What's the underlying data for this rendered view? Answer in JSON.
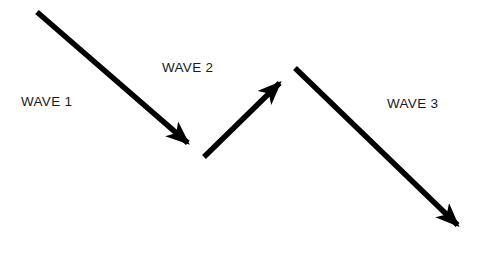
{
  "diagram": {
    "background_color": "#ffffff",
    "stroke_color": "#000000",
    "stroke_width": 5.5,
    "width": 497,
    "height": 260,
    "labels": [
      {
        "id": "wave-1",
        "text": "WAVE 1",
        "x": 21,
        "y": 95
      },
      {
        "id": "wave-2",
        "text": "WAVE 2",
        "x": 162,
        "y": 61
      },
      {
        "id": "wave-3",
        "text": "WAVE 3",
        "x": 387,
        "y": 97
      }
    ],
    "arrows": [
      {
        "id": "wave-1-arrow",
        "name": "wave-1-down-arrow",
        "direction": "down-right",
        "from": {
          "x": 37,
          "y": 12
        },
        "to": {
          "x": 204,
          "y": 157
        },
        "arrowhead": "filled-triangle"
      },
      {
        "id": "wave-2-arrow",
        "name": "wave-2-up-arrow",
        "direction": "up-right",
        "from": {
          "x": 204,
          "y": 157
        },
        "to": {
          "x": 295,
          "y": 68
        },
        "arrowhead": "filled-triangle"
      },
      {
        "id": "wave-3-arrow",
        "name": "wave-3-down-arrow",
        "direction": "down-right",
        "from": {
          "x": 295,
          "y": 68
        },
        "to": {
          "x": 473,
          "y": 240
        },
        "arrowhead": "filled-triangle"
      }
    ]
  },
  "chart_data": {
    "type": "line",
    "title": "",
    "xlabel": "",
    "ylabel": "",
    "series": [
      {
        "name": "price-path",
        "points": [
          {
            "x": 37,
            "y": 12
          },
          {
            "x": 204,
            "y": 157
          },
          {
            "x": 295,
            "y": 68
          },
          {
            "x": 473,
            "y": 240
          }
        ]
      }
    ],
    "annotations": [
      "WAVE 1",
      "WAVE 2",
      "WAVE 3"
    ],
    "grid": false,
    "legend": "none"
  }
}
